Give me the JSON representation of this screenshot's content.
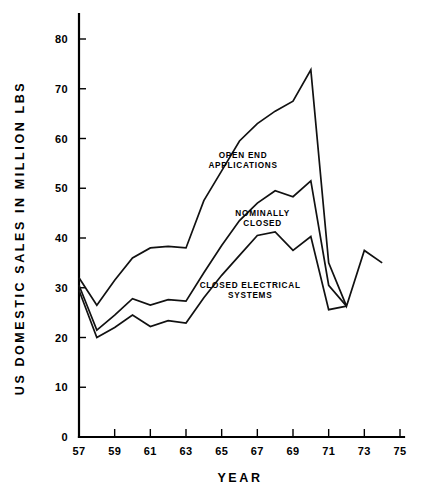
{
  "chart_data": {
    "type": "line",
    "title": "",
    "xlabel": "YEAR",
    "ylabel": "US DOMESTIC SALES IN MILLION LBS",
    "xlim": [
      57,
      75
    ],
    "ylim": [
      0,
      85
    ],
    "xticks": [
      "57",
      "59",
      "61",
      "63",
      "65",
      "67",
      "69",
      "71",
      "73",
      "75"
    ],
    "xtick_values": [
      57,
      59,
      61,
      63,
      65,
      67,
      69,
      71,
      73,
      75
    ],
    "yticks": [
      "0",
      "10",
      "20",
      "30",
      "40",
      "50",
      "60",
      "70",
      "80"
    ],
    "ytick_values": [
      0,
      10,
      20,
      30,
      40,
      50,
      60,
      70,
      80
    ],
    "x": [
      57,
      58,
      59,
      60,
      61,
      62,
      63,
      64,
      65,
      66,
      67,
      68,
      69,
      70,
      71,
      72,
      73,
      74
    ],
    "grid": false,
    "legend_position": "inline-annotations",
    "series": [
      {
        "name": "OPEN END APPLICATIONS",
        "values": [
          32.0,
          26.5,
          31.5,
          36.0,
          38.0,
          38.3,
          38.0,
          47.5,
          53.5,
          59.5,
          63.0,
          65.5,
          67.5,
          73.8,
          35.0,
          26.3,
          37.5,
          35.0
        ]
      },
      {
        "name": "NOMINALLY CLOSED",
        "values": [
          30.5,
          21.5,
          24.5,
          27.8,
          26.5,
          27.6,
          27.3,
          33.0,
          38.5,
          43.5,
          47.0,
          49.5,
          48.3,
          51.5,
          30.5,
          26.3,
          null,
          null
        ]
      },
      {
        "name": "CLOSED ELECTRICAL SYSTEMS",
        "values": [
          29.5,
          20.0,
          22.0,
          24.5,
          22.2,
          23.4,
          22.9,
          28.0,
          32.5,
          36.5,
          40.5,
          41.2,
          37.5,
          40.3,
          25.6,
          26.3,
          null,
          null
        ]
      }
    ],
    "annotations": [
      {
        "text_lines": [
          "OPEN END",
          "APPLICATIONS"
        ],
        "x": 66.2,
        "y": 56.0
      },
      {
        "text_lines": [
          "NOMINALLY",
          "CLOSED"
        ],
        "x": 67.3,
        "y": 44.5
      },
      {
        "text_lines": [
          "CLOSED ELECTRICAL",
          "SYSTEMS"
        ],
        "x": 66.6,
        "y": 30.0
      }
    ]
  }
}
